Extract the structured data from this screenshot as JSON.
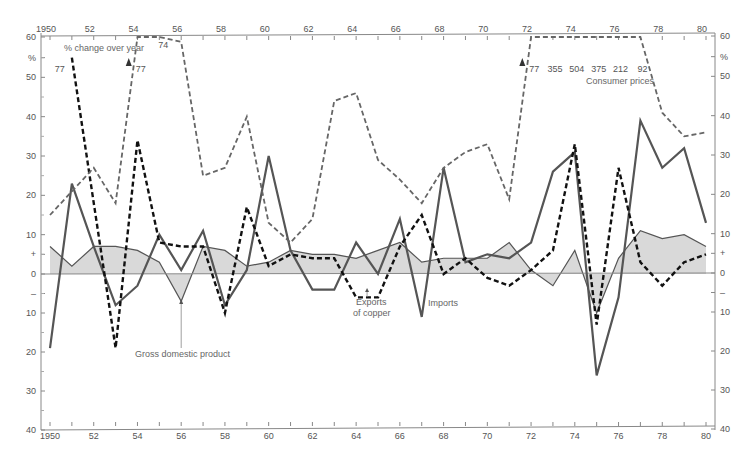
{
  "chart_data": {
    "type": "line",
    "title": "",
    "ylabel": "% change over year",
    "unit_label": "%",
    "xlabel": "",
    "x": [
      1950,
      1951,
      1952,
      1953,
      1954,
      1955,
      1956,
      1957,
      1958,
      1959,
      1960,
      1961,
      1962,
      1963,
      1964,
      1965,
      1966,
      1967,
      1968,
      1969,
      1970,
      1971,
      1972,
      1973,
      1974,
      1975,
      1976,
      1977,
      1978,
      1979,
      1980
    ],
    "xlim": [
      1950,
      1980
    ],
    "ylim": [
      -40,
      60
    ],
    "x_tick_labels": [
      {
        "year": 1950,
        "label": "1950"
      },
      {
        "year": 1952,
        "label": "52"
      },
      {
        "year": 1954,
        "label": "54"
      },
      {
        "year": 1956,
        "label": "56"
      },
      {
        "year": 1958,
        "label": "58"
      },
      {
        "year": 1960,
        "label": "60"
      },
      {
        "year": 1962,
        "label": "62"
      },
      {
        "year": 1964,
        "label": "64"
      },
      {
        "year": 1966,
        "label": "66"
      },
      {
        "year": 1968,
        "label": "68"
      },
      {
        "year": 1970,
        "label": "70"
      },
      {
        "year": 1972,
        "label": "72"
      },
      {
        "year": 1974,
        "label": "74"
      },
      {
        "year": 1976,
        "label": "76"
      },
      {
        "year": 1978,
        "label": "78"
      },
      {
        "year": 1980,
        "label": "80"
      }
    ],
    "y_tick_labels": [
      {
        "value": 60,
        "label": "60"
      },
      {
        "value": 55,
        "label": "%"
      },
      {
        "value": 50,
        "label": "50"
      },
      {
        "value": 40,
        "label": "40"
      },
      {
        "value": 30,
        "label": "30"
      },
      {
        "value": 20,
        "label": "20"
      },
      {
        "value": 10,
        "label": "10"
      },
      {
        "value": 5,
        "label": "+"
      },
      {
        "value": 0,
        "label": "0"
      },
      {
        "value": -5,
        "label": "–"
      },
      {
        "value": -10,
        "label": "10"
      },
      {
        "value": -20,
        "label": "20"
      },
      {
        "value": -30,
        "label": "30"
      },
      {
        "value": -40,
        "label": "40"
      }
    ],
    "grid": false,
    "series": [
      {
        "name": "Gross domestic product",
        "style": "area",
        "color": "#555555",
        "fill": "#d9d9d9",
        "values": [
          7,
          2,
          7,
          7,
          6,
          3,
          -7,
          7,
          6,
          2,
          3,
          6,
          5,
          5,
          4,
          6,
          8,
          3,
          4,
          4,
          4,
          8,
          1,
          -3,
          6,
          -10,
          4,
          11,
          9,
          10,
          7
        ]
      },
      {
        "name": "Imports",
        "style": "solid",
        "color": "#555555",
        "values": [
          -19,
          23,
          7,
          -8,
          -3,
          10,
          1,
          11,
          -8,
          1,
          30,
          6,
          -4,
          -4,
          8,
          0,
          14,
          -11,
          27,
          3,
          5,
          4,
          8,
          26,
          31,
          -26,
          -6,
          39,
          27,
          32,
          13
        ]
      },
      {
        "name": "Exports of copper",
        "style": "dashed-bold",
        "color": "#111111",
        "values": [
          null,
          55,
          null,
          -19,
          34,
          8,
          7,
          7,
          -10,
          17,
          2,
          5,
          4,
          4,
          -6,
          -6,
          7,
          15,
          0,
          4,
          -1,
          -3,
          1,
          6,
          33,
          -13,
          27,
          3,
          -3,
          3,
          5
        ]
      },
      {
        "name": "Consumer prices",
        "style": "dashed",
        "color": "#666666",
        "values": [
          15,
          21,
          27,
          18,
          77,
          74,
          59,
          25,
          27,
          40,
          13,
          8,
          14,
          44,
          46,
          29,
          24,
          18,
          27,
          31,
          33,
          19,
          77,
          355,
          504,
          375,
          212,
          92,
          41,
          35,
          36
        ]
      }
    ],
    "offscale_labels": [
      {
        "year": 1950.9,
        "label": "77",
        "series": "Exports of copper"
      },
      {
        "year": 1953.6,
        "label": "77",
        "series": "Consumer prices"
      },
      {
        "year": 1955,
        "label": "74",
        "series": "Consumer prices"
      },
      {
        "year": 1971.6,
        "label": "77",
        "series": "Consumer prices"
      },
      {
        "year": 1973,
        "label": "355",
        "series": "Consumer prices"
      },
      {
        "year": 1974,
        "label": "504",
        "series": "Consumer prices"
      },
      {
        "year": 1975,
        "label": "375",
        "series": "Consumer prices"
      },
      {
        "year": 1976,
        "label": "212",
        "series": "Consumer prices"
      },
      {
        "year": 1977,
        "label": "92",
        "series": "Consumer prices"
      }
    ],
    "annotations": [
      {
        "text": "% change over year",
        "kind": "axis-title"
      },
      {
        "text": "Consumer prices",
        "kind": "series-label",
        "series": "Consumer prices"
      },
      {
        "text": "Gross domestic product",
        "kind": "series-label",
        "series": "Gross domestic product",
        "points_to_year": 1956
      },
      {
        "text": "Exports",
        "kind": "series-label",
        "series": "Exports of copper",
        "points_to_year": 1964.5
      },
      {
        "text": "of copper",
        "kind": "series-label-cont",
        "series": "Exports of copper"
      },
      {
        "text": "Imports",
        "kind": "series-label",
        "series": "Imports"
      }
    ]
  }
}
